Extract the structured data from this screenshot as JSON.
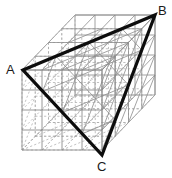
{
  "figure": {
    "type": "geometry-diagram",
    "projection": "oblique",
    "canvas": {
      "width": 172,
      "height": 178,
      "background": "#ffffff"
    },
    "colors": {
      "lattice_solid": "#8c8c8c",
      "lattice_dashed": "#a8a8a8",
      "triangle": "#0d0d0d",
      "label": "#1a1a1a"
    },
    "cube": {
      "divisions": 4,
      "cell_size": 20,
      "front_face_origin": {
        "x": 22,
        "y": 70
      },
      "depth_offset": {
        "dx": 13.25,
        "dy": -13.75
      },
      "front_top_left": {
        "x": 22,
        "y": 70
      },
      "front_top_right": {
        "x": 102,
        "y": 70
      },
      "front_bottom_left": {
        "x": 22,
        "y": 155
      },
      "front_bottom_right": {
        "x": 102,
        "y": 155
      },
      "back_top_left": {
        "x": 75,
        "y": 15
      },
      "back_top_right": {
        "x": 155,
        "y": 15
      },
      "back_bottom_left": {
        "x": 75,
        "y": 100
      },
      "back_bottom_right": {
        "x": 155,
        "y": 100
      }
    },
    "triangle": {
      "stroke_width": 3.2,
      "vertices": [
        {
          "name": "A",
          "label": "A",
          "x": 23,
          "y": 70,
          "label_x": 6,
          "label_y": 63
        },
        {
          "name": "B",
          "label": "B",
          "x": 155,
          "y": 15,
          "label_x": 158,
          "label_y": 4
        },
        {
          "name": "C",
          "label": "C",
          "x": 102,
          "y": 155,
          "label_x": 97,
          "label_y": 160
        }
      ],
      "edges": [
        {
          "from": "A",
          "to": "B"
        },
        {
          "from": "B",
          "to": "C"
        },
        {
          "from": "C",
          "to": "A"
        }
      ]
    },
    "overlay_lines": {
      "description": "diagonal face lines on top and right faces",
      "stroke": "#8c8c8c"
    }
  }
}
